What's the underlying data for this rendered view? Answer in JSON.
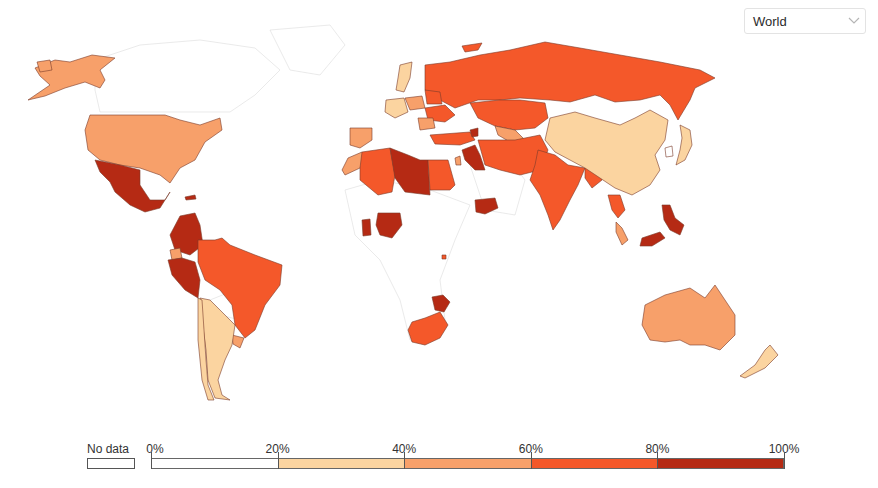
{
  "region_selector": {
    "selected": "World",
    "icon": "chevron-down-icon"
  },
  "legend": {
    "no_data_label": "No data",
    "no_data_color": "#ffffff",
    "ticks": [
      "0%",
      "20%",
      "40%",
      "60%",
      "80%",
      "100%"
    ],
    "bins": [
      {
        "range": "0-20%",
        "color": "#ffffff"
      },
      {
        "range": "20-40%",
        "color": "#fbd4a0"
      },
      {
        "range": "40-60%",
        "color": "#f7a06a"
      },
      {
        "range": "60-80%",
        "color": "#f4582a"
      },
      {
        "range": "80-100%",
        "color": "#b52a14"
      }
    ]
  },
  "map": {
    "countries": [
      {
        "name": "Alaska (United States)",
        "bin": 2
      },
      {
        "name": "United States",
        "bin": 2
      },
      {
        "name": "Mexico",
        "bin": 4
      },
      {
        "name": "Cuba",
        "bin": 4
      },
      {
        "name": "Colombia",
        "bin": 4
      },
      {
        "name": "Ecuador",
        "bin": 2
      },
      {
        "name": "Peru",
        "bin": 4
      },
      {
        "name": "Brazil",
        "bin": 3
      },
      {
        "name": "Uruguay",
        "bin": 2
      },
      {
        "name": "Argentina",
        "bin": 1
      },
      {
        "name": "Chile",
        "bin": 1
      },
      {
        "name": "Russia",
        "bin": 3
      },
      {
        "name": "Kazakhstan",
        "bin": 3
      },
      {
        "name": "Uzbekistan",
        "bin": 2
      },
      {
        "name": "Ukraine",
        "bin": 3
      },
      {
        "name": "Belarus",
        "bin": 3
      },
      {
        "name": "Poland",
        "bin": 2
      },
      {
        "name": "Germany",
        "bin": 1
      },
      {
        "name": "Sweden",
        "bin": 1
      },
      {
        "name": "Romania",
        "bin": 2
      },
      {
        "name": "Turkey",
        "bin": 3
      },
      {
        "name": "Georgia/Armenia",
        "bin": 4
      },
      {
        "name": "Spain",
        "bin": 2
      },
      {
        "name": "Morocco",
        "bin": 2
      },
      {
        "name": "Algeria",
        "bin": 3
      },
      {
        "name": "Libya",
        "bin": 4
      },
      {
        "name": "Egypt",
        "bin": 3
      },
      {
        "name": "Iraq/Syria",
        "bin": 4
      },
      {
        "name": "Israel",
        "bin": 2
      },
      {
        "name": "Iran/Afghanistan/Pakistan",
        "bin": 3
      },
      {
        "name": "India",
        "bin": 3
      },
      {
        "name": "Bangladesh/Myanmar",
        "bin": 3
      },
      {
        "name": "China",
        "bin": 1
      },
      {
        "name": "Mongolia",
        "bin": 0
      },
      {
        "name": "Korea",
        "bin": 1
      },
      {
        "name": "Japan",
        "bin": 3
      },
      {
        "name": "Thailand",
        "bin": 2
      },
      {
        "name": "Malaysia",
        "bin": 4
      },
      {
        "name": "Philippines",
        "bin": 4
      },
      {
        "name": "Indonesia",
        "bin": 4
      },
      {
        "name": "Yemen",
        "bin": 4
      },
      {
        "name": "Ghana",
        "bin": 4
      },
      {
        "name": "Nigeria",
        "bin": 3
      },
      {
        "name": "Rwanda",
        "bin": 4
      },
      {
        "name": "Zimbabwe",
        "bin": 3
      },
      {
        "name": "South Africa",
        "bin": 2
      },
      {
        "name": "Australia",
        "bin": 1
      },
      {
        "name": "New Zealand",
        "bin": 1
      }
    ]
  }
}
